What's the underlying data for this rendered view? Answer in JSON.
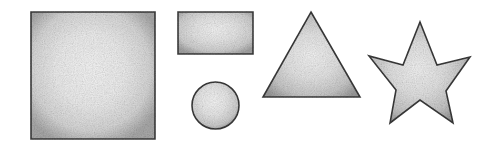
{
  "canvas": {
    "width": 494,
    "height": 144,
    "background_color": "#ffffff",
    "description": "Five grayscale geometric shapes on a white background"
  },
  "style": {
    "outline_color": "#3a3a3a",
    "outline_width": 1.6,
    "fill_center_color": "#f2f2f2",
    "fill_mid_color": "#dcdcdc",
    "fill_edge_color": "#a8a8a8",
    "texture": "grainy-noise",
    "texture_opacity": 0.5
  },
  "shapes": [
    {
      "id": "square",
      "name": "square",
      "label": "Square",
      "type": "rect",
      "x": 31,
      "y": 12,
      "width": 124,
      "height": 127,
      "center_x": 93,
      "center_y": 75.5
    },
    {
      "id": "rectangle",
      "name": "rectangle",
      "label": "Rectangle",
      "type": "rect",
      "x": 178,
      "y": 12,
      "width": 75,
      "height": 42,
      "center_x": 215.5,
      "center_y": 33
    },
    {
      "id": "circle",
      "name": "circle",
      "label": "Circle",
      "type": "circle",
      "cx": 215.5,
      "cy": 105.5,
      "r": 23.5
    },
    {
      "id": "triangle",
      "name": "triangle",
      "label": "Triangle",
      "type": "polygon",
      "points": "311,12 360,97 263,97",
      "center_x": 311,
      "center_y": 68
    },
    {
      "id": "star",
      "name": "star",
      "label": "Five-pointed star",
      "type": "polygon",
      "points": "420,22 437,65 470,57 446,91 453,123 420,100 390,123 396,90 369,56 403,65",
      "center_x": 420,
      "center_y": 74
    }
  ]
}
